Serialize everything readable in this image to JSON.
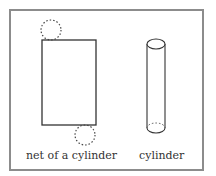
{
  "figure": {
    "frame_color": "#8c8c8c",
    "stroke_color": "#333333",
    "labels": {
      "net": "net of a cylinder",
      "cylinder": "cylinder"
    },
    "shapes": {
      "net": {
        "rectangle": {
          "x": 42,
          "y": 40,
          "width": 54,
          "height": 85
        },
        "top_circle": {
          "cx": 51,
          "cy": 30,
          "r": 10,
          "style": "dashed"
        },
        "bottom_circle": {
          "cx": 85,
          "cy": 135,
          "r": 10,
          "style": "dashed"
        }
      },
      "cylinder": {
        "cx": 156,
        "top_y": 44,
        "bottom_y": 128,
        "rx": 9,
        "ry": 5
      }
    }
  }
}
